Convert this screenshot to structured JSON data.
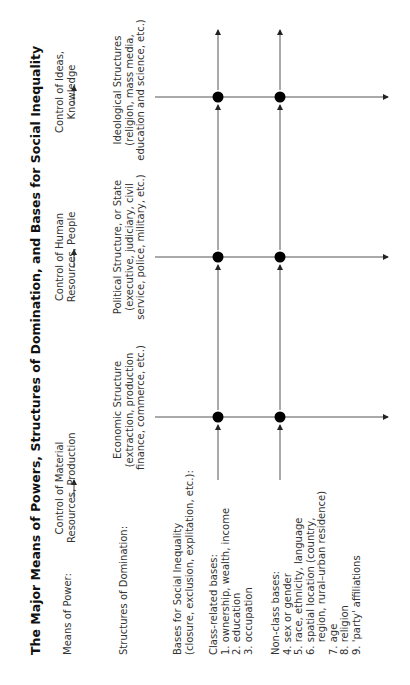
{
  "title": "The Major Means of Powers, Structures of Domination, and Bases for Social Inequality",
  "row_labels": {
    "means_of_power": "Means of Power:",
    "structures_of_domination": "Structures of Domination:"
  },
  "columns": [
    {
      "means": [
        "Control of Material",
        "Resources, Production"
      ],
      "structure": [
        "Economic Structure",
        "(extraction, production",
        "finance, commerce, etc.)"
      ]
    },
    {
      "means": [
        "Control of Human",
        "Resources, People"
      ],
      "structure": [
        "Political Structure, or State",
        "(executive, judiciary, civil",
        "service, police, military, etc.)"
      ]
    },
    {
      "means": [
        "Control of Ideas,",
        "Knowledge"
      ],
      "structure": [
        "Ideological Structures",
        "(religion, mass media,",
        "education and science, etc.)"
      ]
    }
  ],
  "bases": {
    "heading": [
      "Bases for Social Inequality",
      "(closure, exclusion, explitation, etc.):"
    ],
    "class_related": {
      "label": "Class-related bases:",
      "items": [
        "1. ownership, wealth, income",
        "2. education",
        "3. occupation"
      ]
    },
    "non_class": {
      "label": "Non-class bases:",
      "items": [
        "4. sex or gender",
        "5. race, ethnicity, language",
        "6. spatial location (country,",
        "    region, rural–urban residence)",
        "7. age",
        "8. religion",
        "9. 'party' affiliations"
      ]
    }
  },
  "colors": {
    "line": "#555555",
    "dot": "#000000",
    "text": "#333333"
  }
}
